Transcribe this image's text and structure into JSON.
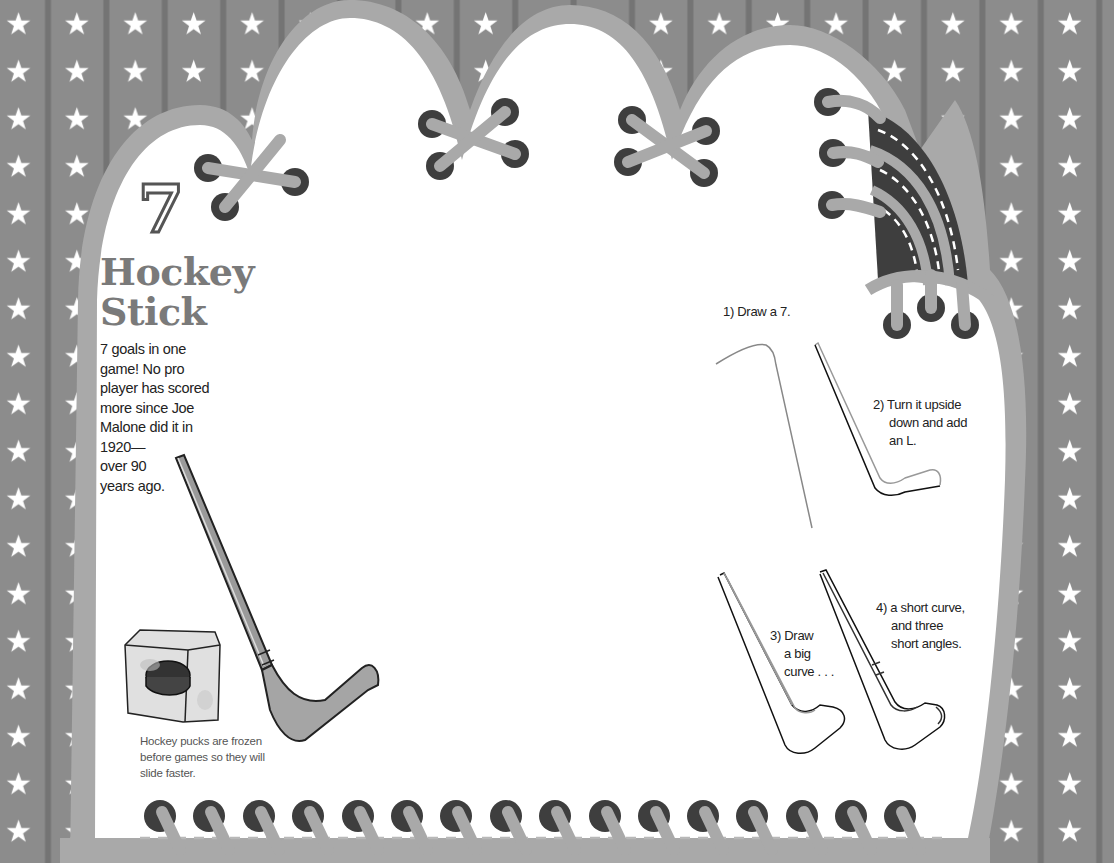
{
  "page": {
    "number": "7",
    "title_lines": [
      "Hockey",
      "Stick"
    ],
    "fact_lines": [
      "7 goals in one",
      "game! No pro",
      "player has scored",
      "more since Joe",
      "Malone did it in",
      "1920—",
      "over 90",
      "years ago."
    ],
    "caption_lines": [
      "Hockey pucks are frozen",
      "before games so they will",
      "slide faster."
    ]
  },
  "steps": [
    {
      "label_lines": [
        "1) Draw a 7."
      ]
    },
    {
      "label_lines": [
        "2) Turn it upside",
        "down and add",
        "an L."
      ]
    },
    {
      "label_lines": [
        "3) Draw",
        "a big",
        "curve . . ."
      ]
    },
    {
      "label_lines": [
        "4) a short curve,",
        "and three",
        "short angles."
      ]
    }
  ],
  "colors": {
    "background": "#8c8c8c",
    "stripe": "#747474",
    "star": "#ffffff",
    "panel": "#ffffff",
    "outline": "#a9a9a9",
    "eyelet": "#3e3e3e",
    "lace": "#a9a9a9",
    "title": "#7a7a7a"
  },
  "icons": {
    "background": "star-icon",
    "illustration_main": "hockey-stick-icon",
    "illustration_puck": "frozen-puck-icon"
  }
}
